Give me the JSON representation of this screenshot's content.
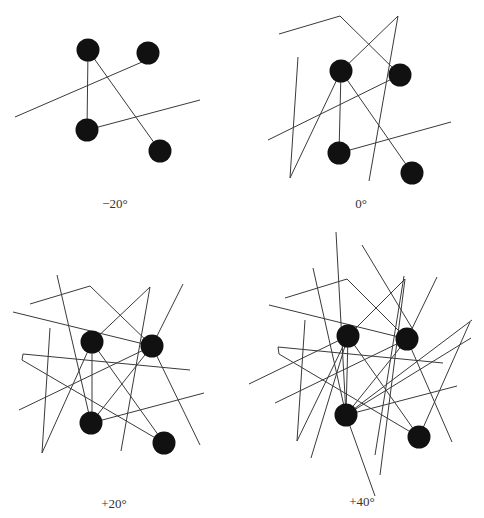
{
  "figure": {
    "node_color": "#111111",
    "line_color": "#3a3a3a",
    "node_radius": 11.5
  },
  "panels": [
    {
      "label": "−20°",
      "label_pos": [
        115,
        205
      ],
      "nodes": [
        [
          88,
          50
        ],
        [
          148,
          53
        ],
        [
          87,
          130
        ],
        [
          160,
          151
        ]
      ],
      "lines": [
        [
          [
            88,
            50
          ],
          [
            87,
            130
          ]
        ],
        [
          [
            88,
            50
          ],
          [
            160,
            151
          ]
        ],
        [
          [
            15,
            117
          ],
          [
            142,
            62
          ]
        ],
        [
          [
            87,
            130
          ],
          [
            200,
            100
          ]
        ]
      ]
    },
    {
      "label": "0°",
      "label_pos": [
        361,
        205
      ],
      "nodes": [
        [
          341,
          71
        ],
        [
          400,
          75
        ],
        [
          339,
          153
        ],
        [
          412,
          173
        ]
      ],
      "lines": [
        [
          [
            279,
            34
          ],
          [
            340,
            16
          ],
          [
            400,
            75
          ]
        ],
        [
          [
            341,
            71
          ],
          [
            398,
            16
          ],
          [
            369,
            181
          ]
        ],
        [
          [
            298,
            57
          ],
          [
            290,
            178
          ],
          [
            341,
            71
          ]
        ],
        [
          [
            268,
            140
          ],
          [
            400,
            75
          ]
        ],
        [
          [
            341,
            71
          ],
          [
            339,
            153
          ]
        ],
        [
          [
            341,
            71
          ],
          [
            412,
            173
          ]
        ],
        [
          [
            339,
            153
          ],
          [
            451,
            122
          ]
        ]
      ]
    },
    {
      "label": "+20°",
      "label_pos": [
        114,
        505
      ],
      "nodes": [
        [
          92,
          342
        ],
        [
          152,
          346
        ],
        [
          91,
          423
        ],
        [
          164,
          443
        ]
      ],
      "lines": [
        [
          [
            30,
            304
          ],
          [
            90,
            286
          ],
          [
            152,
            346
          ]
        ],
        [
          [
            92,
            342
          ],
          [
            150,
            287
          ],
          [
            121,
            451
          ]
        ],
        [
          [
            50,
            328
          ],
          [
            42,
            453
          ],
          [
            92,
            342
          ]
        ],
        [
          [
            13,
            312
          ],
          [
            152,
            346
          ]
        ],
        [
          [
            152,
            346
          ],
          [
            183,
            284
          ]
        ],
        [
          [
            57,
            275
          ],
          [
            91,
            423
          ]
        ],
        [
          [
            23,
            354
          ],
          [
            190,
            370
          ]
        ],
        [
          [
            23,
            354
          ],
          [
            22,
            360
          ],
          [
            164,
            443
          ]
        ],
        [
          [
            19,
            410
          ],
          [
            152,
            346
          ]
        ],
        [
          [
            92,
            342
          ],
          [
            92,
            423
          ]
        ],
        [
          [
            92,
            342
          ],
          [
            164,
            443
          ]
        ],
        [
          [
            91,
            423
          ],
          [
            152,
            346
          ]
        ],
        [
          [
            91,
            423
          ],
          [
            204,
            393
          ]
        ],
        [
          [
            152,
            346
          ],
          [
            200,
            445
          ]
        ]
      ]
    },
    {
      "label": "+40°",
      "label_pos": [
        362,
        503
      ],
      "nodes": [
        [
          348,
          336
        ],
        [
          407,
          339
        ],
        [
          346,
          415
        ],
        [
          419,
          437
        ]
      ],
      "lines": [
        [
          [
            285,
            298
          ],
          [
            347,
            279
          ],
          [
            407,
            339
          ]
        ],
        [
          [
            348,
            336
          ],
          [
            405,
            279
          ],
          [
            380,
            475
          ]
        ],
        [
          [
            305,
            320
          ],
          [
            297,
            441
          ],
          [
            348,
            336
          ]
        ],
        [
          [
            269,
            305
          ],
          [
            407,
            339
          ]
        ],
        [
          [
            407,
            339
          ],
          [
            437,
            277
          ]
        ],
        [
          [
            313,
            268
          ],
          [
            346,
            415
          ]
        ],
        [
          [
            278,
            347
          ],
          [
            443,
            363
          ]
        ],
        [
          [
            278,
            347
          ],
          [
            279,
            354
          ],
          [
            419,
            437
          ]
        ],
        [
          [
            249,
            384
          ],
          [
            348,
            336
          ]
        ],
        [
          [
            348,
            336
          ],
          [
            346,
            415
          ]
        ],
        [
          [
            348,
            336
          ],
          [
            419,
            437
          ]
        ],
        [
          [
            346,
            415
          ],
          [
            407,
            339
          ]
        ],
        [
          [
            346,
            415
          ],
          [
            457,
            386
          ]
        ],
        [
          [
            407,
            339
          ],
          [
            452,
            442
          ]
        ],
        [
          [
            336,
            232
          ],
          [
            346,
            415
          ]
        ],
        [
          [
            362,
            245
          ],
          [
            418,
            338
          ]
        ],
        [
          [
            275,
            403
          ],
          [
            407,
            339
          ]
        ],
        [
          [
            311,
            458
          ],
          [
            348,
            336
          ]
        ],
        [
          [
            346,
            415
          ],
          [
            471,
            338
          ]
        ],
        [
          [
            346,
            415
          ],
          [
            472,
            320
          ]
        ],
        [
          [
            419,
            437
          ],
          [
            470,
            322
          ]
        ],
        [
          [
            346,
            415
          ],
          [
            375,
            496
          ]
        ],
        [
          [
            404,
            276
          ],
          [
            375,
            455
          ]
        ]
      ]
    }
  ]
}
